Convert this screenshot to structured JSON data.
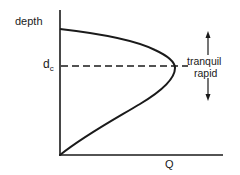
{
  "diagram": {
    "type": "specific-energy-style depth vs discharge curve",
    "y_axis_label": "depth",
    "x_axis_label": "Q",
    "critical_depth": {
      "label_main": "d",
      "label_sub": "c",
      "line_style": "dashed"
    },
    "regimes": {
      "upper": "tranquil",
      "lower": "rapid"
    },
    "arrows": [
      {
        "direction": "up",
        "meaning": "tranquil"
      },
      {
        "direction": "down",
        "meaning": "rapid"
      }
    ],
    "colors": {
      "line": "#1a1a1a",
      "background": "#ffffff"
    }
  }
}
